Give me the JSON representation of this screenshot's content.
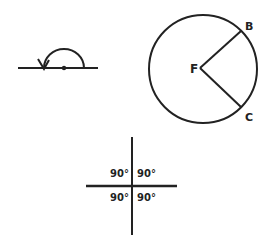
{
  "colors": {
    "ink": "#222222",
    "background": "#ffffff"
  },
  "figures": {
    "straight_angle": {
      "description": "Straight line with center point and a 180 degree rotation arc ending in an arrow",
      "line": {
        "x1": 18,
        "y1": 68,
        "x2": 98,
        "y2": 68
      },
      "vertex": {
        "x": 64,
        "y": 68
      },
      "arc": {
        "start_x": 84,
        "end_x": 44,
        "y": 68,
        "radius": 20
      },
      "arrow_icon": "arrowhead-left-down"
    },
    "circle": {
      "center": {
        "x": 203,
        "y": 69
      },
      "radius": 54,
      "center_label": "F",
      "points": [
        {
          "label": "B",
          "x": 241,
          "y": 31
        },
        {
          "label": "C",
          "x": 241,
          "y": 107
        }
      ]
    },
    "perpendicular_cross": {
      "horizontal": {
        "x1": 86,
        "y1": 186,
        "x2": 177,
        "y2": 186
      },
      "vertical": {
        "x1": 132,
        "y1": 137,
        "x2": 132,
        "y2": 235
      },
      "angle_labels": [
        "90°",
        "90°",
        "90°",
        "90°"
      ]
    }
  }
}
